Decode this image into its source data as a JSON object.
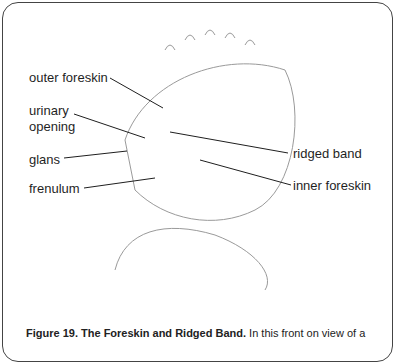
{
  "figure": {
    "labels": {
      "outer_foreskin": "outer foreskin",
      "urinary_opening_1": "urinary",
      "urinary_opening_2": "opening",
      "glans": "glans",
      "frenulum": "frenulum",
      "ridged_band": "ridged band",
      "inner_foreskin": "inner foreskin"
    },
    "caption": {
      "title": "Figure 19. The Foreskin and Ridged Band.",
      "text": " In this front on view of a"
    },
    "colors": {
      "ink": "#1f1f1f",
      "sketch": "#8a8a8a",
      "border": "#444444"
    }
  }
}
